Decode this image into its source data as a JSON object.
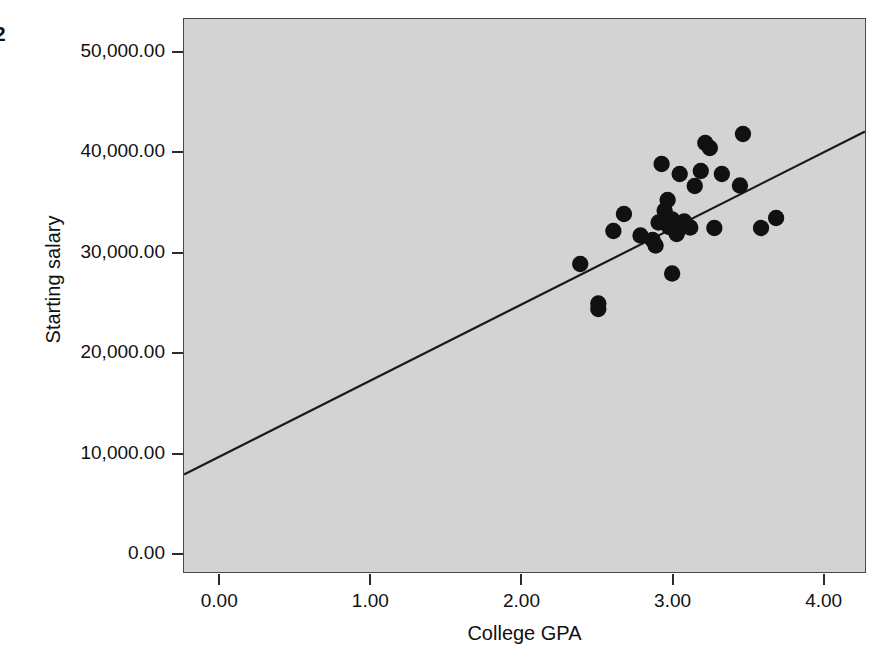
{
  "figure": {
    "corner_label": "2",
    "background_color": "#ffffff",
    "plot_background_color": "#d3d3d3",
    "marker_color": "#111111",
    "line_color": "#1a1a1a"
  },
  "chart_data": {
    "type": "scatter",
    "title": "",
    "xlabel": "College GPA",
    "ylabel": "Starting salary",
    "xlim": [
      -0.24,
      4.28
    ],
    "ylim": [
      -1900,
      53400
    ],
    "grid": false,
    "legend": null,
    "xticks": [
      0,
      1,
      2,
      3,
      4
    ],
    "xticklabels": [
      "0.00",
      "1.00",
      "2.00",
      "3.00",
      "4.00"
    ],
    "yticks": [
      0,
      10000,
      20000,
      30000,
      40000,
      50000
    ],
    "yticklabels": [
      "0.00",
      "10,000.00",
      "20,000.00",
      "30,000.00",
      "40,000.00",
      "50,000.00"
    ],
    "x": [
      2.39,
      2.51,
      2.51,
      2.61,
      2.68,
      2.79,
      2.87,
      2.9,
      2.92,
      2.93,
      2.95,
      2.96,
      2.98,
      2.99,
      3.01,
      3.02,
      3.03,
      3.04,
      3.05,
      3.07,
      3.1,
      3.12,
      3.17,
      3.19,
      3.22,
      3.25,
      3.31,
      3.38,
      3.44,
      3.48,
      3.52,
      3.61,
      3.69
    ],
    "y": [
      28900,
      24950,
      24400,
      32200,
      33900,
      31750,
      31300,
      30750,
      33050,
      38900,
      34250,
      35300,
      32600,
      33350,
      37900,
      32800,
      31900,
      27950,
      32550,
      33150,
      32550,
      36700,
      38200,
      41000,
      40500,
      32500,
      37900,
      36750,
      41900,
      32500,
      33500
    ],
    "points": [
      {
        "x": 2.39,
        "y": 28900
      },
      {
        "x": 2.51,
        "y": 24950
      },
      {
        "x": 2.51,
        "y": 24400
      },
      {
        "x": 2.61,
        "y": 32200
      },
      {
        "x": 2.68,
        "y": 33900
      },
      {
        "x": 2.79,
        "y": 31750
      },
      {
        "x": 2.87,
        "y": 31300
      },
      {
        "x": 2.89,
        "y": 30750
      },
      {
        "x": 2.91,
        "y": 33050
      },
      {
        "x": 2.93,
        "y": 38900
      },
      {
        "x": 2.95,
        "y": 34250
      },
      {
        "x": 2.97,
        "y": 35300
      },
      {
        "x": 2.98,
        "y": 32600
      },
      {
        "x": 3.0,
        "y": 33350
      },
      {
        "x": 3.0,
        "y": 27950
      },
      {
        "x": 3.02,
        "y": 32800
      },
      {
        "x": 3.03,
        "y": 31900
      },
      {
        "x": 3.05,
        "y": 37900
      },
      {
        "x": 3.06,
        "y": 32550
      },
      {
        "x": 3.08,
        "y": 33150
      },
      {
        "x": 3.12,
        "y": 32550
      },
      {
        "x": 3.15,
        "y": 36700
      },
      {
        "x": 3.19,
        "y": 38200
      },
      {
        "x": 3.22,
        "y": 41000
      },
      {
        "x": 3.25,
        "y": 40500
      },
      {
        "x": 3.28,
        "y": 32500
      },
      {
        "x": 3.33,
        "y": 37900
      },
      {
        "x": 3.45,
        "y": 36750
      },
      {
        "x": 3.47,
        "y": 41900
      },
      {
        "x": 3.59,
        "y": 32500
      },
      {
        "x": 3.69,
        "y": 33500
      }
    ],
    "fit_line": {
      "label": "linear regression line",
      "x_start": -0.24,
      "y_start": 7850,
      "x_end": 4.28,
      "y_end": 42150,
      "slope": 7588,
      "intercept": 9671
    },
    "n_points": 31
  }
}
